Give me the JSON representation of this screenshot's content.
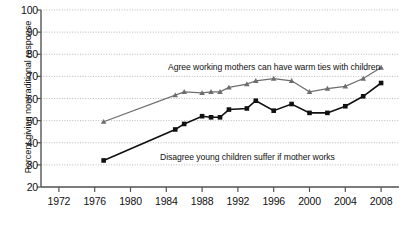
{
  "chart_data": {
    "type": "line",
    "title": "",
    "xlabel": "",
    "ylabel": "Percent giving nontraditional response",
    "xlim": [
      1970,
      2010
    ],
    "ylim": [
      20,
      100
    ],
    "xticks": [
      1972,
      1976,
      1980,
      1984,
      1988,
      1992,
      1996,
      2000,
      2004,
      2008
    ],
    "yticks": [
      20,
      30,
      40,
      50,
      60,
      70,
      80,
      90,
      100
    ],
    "grid": "horizontal-dotted",
    "legend": "inline-annotations",
    "series": [
      {
        "name": "Agree working mothers can have warm ties with children",
        "color": "#6e6e6e",
        "marker": "triangle",
        "annotation": "Agree working mothers can have warm ties with children",
        "points": [
          {
            "x": 1977,
            "y": 49.5
          },
          {
            "x": 1985,
            "y": 61.5
          },
          {
            "x": 1986,
            "y": 63.0
          },
          {
            "x": 1988,
            "y": 62.5
          },
          {
            "x": 1989,
            "y": 63.0
          },
          {
            "x": 1990,
            "y": 63.0
          },
          {
            "x": 1991,
            "y": 65.0
          },
          {
            "x": 1993,
            "y": 66.5
          },
          {
            "x": 1994,
            "y": 68.0
          },
          {
            "x": 1996,
            "y": 69.0
          },
          {
            "x": 1998,
            "y": 68.0
          },
          {
            "x": 2000,
            "y": 63.0
          },
          {
            "x": 2002,
            "y": 64.5
          },
          {
            "x": 2004,
            "y": 65.5
          },
          {
            "x": 2006,
            "y": 69.0
          },
          {
            "x": 2008,
            "y": 74.0
          }
        ]
      },
      {
        "name": "Disagree young children suffer if mother works",
        "color": "#111111",
        "marker": "square",
        "annotation": "Disagree young children suffer if mother works",
        "points": [
          {
            "x": 1977,
            "y": 32.0
          },
          {
            "x": 1985,
            "y": 46.0
          },
          {
            "x": 1986,
            "y": 48.5
          },
          {
            "x": 1988,
            "y": 52.0
          },
          {
            "x": 1989,
            "y": 51.5
          },
          {
            "x": 1990,
            "y": 51.5
          },
          {
            "x": 1991,
            "y": 55.0
          },
          {
            "x": 1993,
            "y": 55.5
          },
          {
            "x": 1994,
            "y": 59.0
          },
          {
            "x": 1996,
            "y": 54.5
          },
          {
            "x": 1998,
            "y": 57.5
          },
          {
            "x": 2000,
            "y": 53.5
          },
          {
            "x": 2002,
            "y": 53.5
          },
          {
            "x": 2004,
            "y": 56.5
          },
          {
            "x": 2006,
            "y": 61.0
          },
          {
            "x": 2008,
            "y": 67.0
          }
        ]
      }
    ],
    "annotations": [
      {
        "id": "agree-label",
        "text": "Agree working mothers can have warm ties with children",
        "x_px": 168,
        "y_px": 62
      },
      {
        "id": "disagree-label",
        "text": "Disagree young children suffer if mother works",
        "x_px": 160,
        "y_px": 152
      }
    ]
  }
}
